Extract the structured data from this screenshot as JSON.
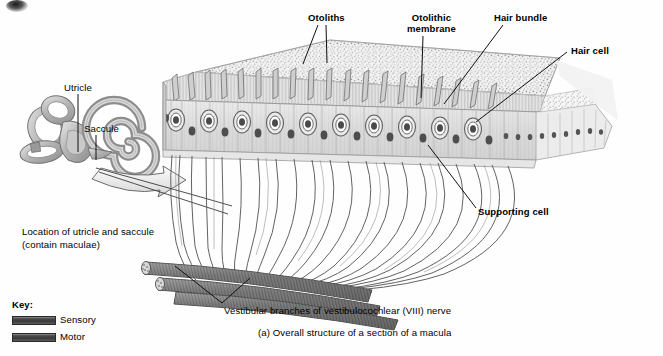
{
  "figure": {
    "caption": "(a) Overall structure of a section of a macula",
    "background_color": "#fefefe",
    "ink_color": "#1a1a1a"
  },
  "labels": {
    "otoliths": "Otoliths",
    "otolithic_membrane_line1": "Otolithic",
    "otolithic_membrane_line2": "membrane",
    "hair_bundle": "Hair bundle",
    "hair_cell": "Hair cell",
    "supporting_cell": "Supporting cell",
    "utricle": "Utricle",
    "saccule": "Saccule",
    "location_line1": "Location of utricle and saccule",
    "location_line2": "(contain maculae)",
    "vestibular_nerve": "Vestibular branches of vestibulocochlear (VIII) nerve"
  },
  "key": {
    "title": "Key:",
    "items": [
      {
        "label": "Sensory",
        "color": "#4a4a4a"
      },
      {
        "label": "Motor",
        "color": "#4a4a4a"
      }
    ]
  },
  "diagram": {
    "structures": [
      "bony-labyrinth",
      "cochlea-spiral",
      "semicircular-canals",
      "macula-block",
      "otolithic-membrane",
      "otolith-layer",
      "hair-cell-row",
      "supporting-cell-row",
      "nerve-fiber-bundle",
      "vestibular-nerve-trunks",
      "magnification-arrow"
    ],
    "hair_cell_count": 14,
    "distal_cell_count": 15,
    "nerve_trunk_count": 3
  }
}
